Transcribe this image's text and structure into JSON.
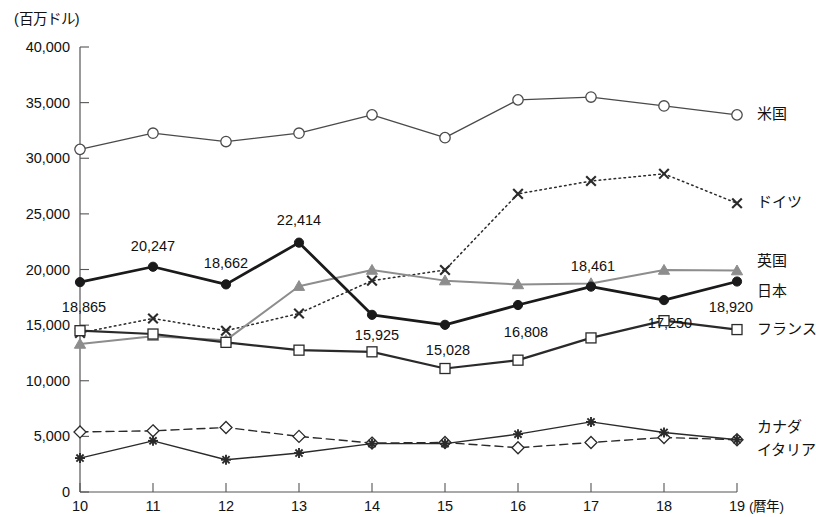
{
  "chart_data": {
    "type": "line",
    "title": "",
    "unit_label": "(百万ドル)",
    "xlabel": "(暦年)",
    "ylabel": "",
    "x": [
      "10",
      "11",
      "12",
      "13",
      "14",
      "15",
      "16",
      "17",
      "18",
      "19"
    ],
    "categories": [
      "10",
      "11",
      "12",
      "13",
      "14",
      "15",
      "16",
      "17",
      "18",
      "19"
    ],
    "xlim": [
      10,
      19
    ],
    "ylim": [
      0,
      40000
    ],
    "y_ticks": [
      0,
      5000,
      10000,
      15000,
      20000,
      25000,
      30000,
      35000,
      40000
    ],
    "y_tick_labels": [
      "0",
      "5,000",
      "10,000",
      "15,000",
      "20,000",
      "25,000",
      "30,000",
      "35,000",
      "40,000"
    ],
    "x_ticks": [
      "10",
      "11",
      "12",
      "13",
      "14",
      "15",
      "16",
      "17",
      "18",
      "19"
    ],
    "grid": false,
    "legend_position": "right-inline",
    "series": [
      {
        "name": "米国",
        "key": "usa",
        "marker": "open-circle",
        "line_style": "solid",
        "color": "#4a4a4a",
        "line_width": 1.3,
        "values": [
          30800,
          32250,
          31500,
          32250,
          33900,
          31850,
          35250,
          35500,
          34700,
          33900
        ],
        "data_labels": []
      },
      {
        "name": "ドイツ",
        "key": "germany",
        "marker": "cross-x",
        "line_style": "dotted",
        "color": "#2a2a2a",
        "line_width": 1.5,
        "values": [
          14300,
          15600,
          14500,
          16050,
          19000,
          19950,
          26800,
          27950,
          28600,
          25950
        ],
        "data_labels": []
      },
      {
        "name": "英国",
        "key": "uk",
        "marker": "filled-triangle",
        "line_style": "solid",
        "color": "#8d8d8d",
        "line_width": 2.0,
        "values": [
          13300,
          14000,
          13650,
          18500,
          19950,
          19000,
          18650,
          18750,
          19950,
          19900
        ],
        "data_labels": []
      },
      {
        "name": "日本",
        "key": "japan",
        "marker": "filled-circle",
        "line_style": "solid",
        "color": "#1a1a1a",
        "line_width": 2.8,
        "values": [
          18865,
          20247,
          18662,
          22414,
          15925,
          15028,
          16808,
          18461,
          17250,
          18920
        ],
        "data_labels": [
          "18,865",
          "20,247",
          "18,662",
          "22,414",
          "15,925",
          "15,028",
          "16,808",
          "18,461",
          "17,250",
          "18,920"
        ]
      },
      {
        "name": "フランス",
        "key": "france",
        "marker": "open-square",
        "line_style": "solid",
        "color": "#2a2a2a",
        "line_width": 2.2,
        "values": [
          14500,
          14200,
          13450,
          12750,
          12600,
          11100,
          11850,
          13850,
          15400,
          14600
        ],
        "data_labels": []
      },
      {
        "name": "カナダ",
        "key": "canada",
        "marker": "open-diamond",
        "line_style": "dashed",
        "color": "#2a2a2a",
        "line_width": 1.4,
        "values": [
          5400,
          5500,
          5800,
          5000,
          4400,
          4450,
          3980,
          4450,
          4900,
          4700
        ],
        "data_labels": []
      },
      {
        "name": "イタリア",
        "key": "italy",
        "marker": "star",
        "line_style": "solid",
        "color": "#2a2a2a",
        "line_width": 1.4,
        "values": [
          3050,
          4600,
          2900,
          3500,
          4350,
          4350,
          5200,
          6300,
          5350,
          4700
        ],
        "data_labels": []
      }
    ],
    "series_labels_right": [
      {
        "name": "米国",
        "value_at_end": 33900
      },
      {
        "name": "ドイツ",
        "value_at_end": 25950
      },
      {
        "name": "英国",
        "value_at_end": 19900
      },
      {
        "name": "日本",
        "value_at_end": 18920
      },
      {
        "name": "フランス",
        "value_at_end": 14600
      },
      {
        "name": "カナダ",
        "value_at_end": 4700
      },
      {
        "name": "イタリア",
        "value_at_end": 4700
      }
    ]
  }
}
